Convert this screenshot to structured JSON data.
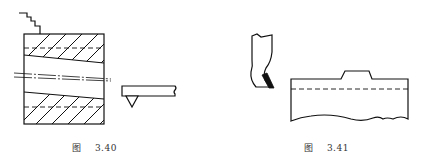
{
  "figures": [
    {
      "id": "3.40",
      "caption": {
        "label": "图",
        "number": "3.40"
      },
      "elements": [
        "stepped-line",
        "hatched-block-with-tapered-bore",
        "centerline",
        "cutting-tool-with-tip"
      ]
    },
    {
      "id": "3.41",
      "caption": {
        "label": "图",
        "number": "3.41"
      },
      "elements": [
        "tool-holder-with-black-insert",
        "workpiece-with-raised-step",
        "dashed-depth-line"
      ]
    }
  ],
  "colors": {
    "line": "#111111",
    "background": "#ffffff",
    "caption": "#333333"
  }
}
